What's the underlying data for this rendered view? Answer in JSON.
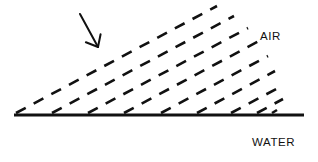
{
  "figure": {
    "width": 318,
    "height": 162,
    "background_color": "#ffffff",
    "ink_color": "#111111"
  },
  "labels": {
    "air": "AIR",
    "water": "WATER"
  },
  "interface": {
    "name": "water-surface-line",
    "style": "solid",
    "color": "#111111",
    "thickness": 3,
    "x_start": 14,
    "x_end": 304,
    "y": 115
  },
  "arrow": {
    "name": "incident-direction-arrow",
    "label": "",
    "color": "#111111",
    "tail_x": 80,
    "tail_y": 14,
    "head_x": 98,
    "head_y": 47,
    "angle_deg": 61
  },
  "chart_data": {
    "type": "line",
    "xlabel": "",
    "ylabel": "",
    "xlim": [
      0,
      318
    ],
    "ylim": [
      162,
      0
    ],
    "grid": false,
    "legend": "none",
    "annotations": [
      {
        "text": "AIR",
        "x": 260,
        "y": 36
      },
      {
        "text": "WATER",
        "x": 252,
        "y": 143
      }
    ],
    "series": [
      {
        "name": "water-surface",
        "style": "solid",
        "color": "#111111",
        "width": 3,
        "points": [
          [
            14,
            115
          ],
          [
            304,
            115
          ]
        ]
      },
      {
        "name": "ray-1",
        "style": "dashed",
        "color": "#111111",
        "width": 2.6,
        "points": [
          [
            16,
            113
          ],
          [
            217,
            6
          ]
        ]
      },
      {
        "name": "ray-2",
        "style": "dashed",
        "color": "#111111",
        "width": 2.6,
        "points": [
          [
            52,
            113
          ],
          [
            234,
            16
          ]
        ]
      },
      {
        "name": "ray-3",
        "style": "dashed",
        "color": "#111111",
        "width": 2.6,
        "points": [
          [
            88,
            113
          ],
          [
            248,
            28
          ]
        ]
      },
      {
        "name": "ray-4",
        "style": "dashed",
        "color": "#111111",
        "width": 2.6,
        "points": [
          [
            124,
            113
          ],
          [
            259,
            41
          ]
        ]
      },
      {
        "name": "ray-5",
        "style": "dashed",
        "color": "#111111",
        "width": 2.6,
        "points": [
          [
            161,
            113
          ],
          [
            268,
            56
          ]
        ]
      },
      {
        "name": "ray-6",
        "style": "dashed",
        "color": "#111111",
        "width": 2.6,
        "points": [
          [
            197,
            113
          ],
          [
            275,
            71
          ]
        ]
      },
      {
        "name": "ray-7",
        "style": "dashed",
        "color": "#111111",
        "width": 2.6,
        "points": [
          [
            231,
            113
          ],
          [
            280,
            87
          ]
        ]
      },
      {
        "name": "ray-8",
        "style": "dashed",
        "color": "#111111",
        "width": 2.6,
        "points": [
          [
            257,
            113
          ],
          [
            283,
            99
          ]
        ]
      },
      {
        "name": "ray-9-stub",
        "style": "dashed",
        "color": "#111111",
        "width": 2.6,
        "points": [
          [
            272,
            113
          ],
          [
            277,
            110
          ]
        ]
      },
      {
        "name": "incident-arrow",
        "style": "solid-arrow",
        "color": "#111111",
        "width": 2,
        "points": [
          [
            80,
            14
          ],
          [
            98,
            47
          ]
        ]
      }
    ]
  }
}
